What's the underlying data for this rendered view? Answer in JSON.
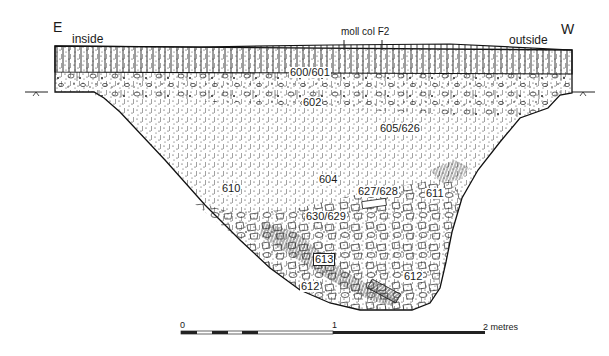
{
  "figure": {
    "type": "archaeological section drawing",
    "orientation": {
      "left": "E",
      "right": "W"
    },
    "side_labels": {
      "left": "inside",
      "right": "outside"
    },
    "annotation": "moll col F2",
    "contexts": [
      {
        "id": "600/601",
        "x": 289,
        "y": 67
      },
      {
        "id": "602",
        "x": 302,
        "y": 97
      },
      {
        "id": "605/626",
        "x": 379,
        "y": 123
      },
      {
        "id": "604",
        "x": 318,
        "y": 174
      },
      {
        "id": "610",
        "x": 221,
        "y": 183
      },
      {
        "id": "627/628",
        "x": 357,
        "y": 186
      },
      {
        "id": "611",
        "x": 425,
        "y": 188
      },
      {
        "id": "630/629",
        "x": 305,
        "y": 211
      },
      {
        "id": "613",
        "x": 313,
        "y": 253
      },
      {
        "id": "612",
        "x": 300,
        "y": 281
      },
      {
        "id": "612",
        "x": 403,
        "y": 271
      }
    ],
    "scale_bar": {
      "labels": [
        "0",
        "1",
        "2 metres"
      ],
      "unit": "metres",
      "max": 2
    }
  }
}
